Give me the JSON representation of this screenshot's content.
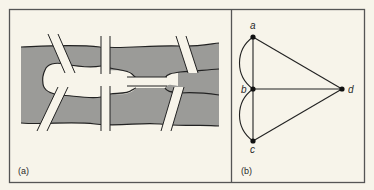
{
  "figure": {
    "panels": [
      {
        "id": "a",
        "label": "(a)",
        "description": "River with two islands and seven bridges (Königsberg bridges map)",
        "bridge_count": 7,
        "island_count": 2
      },
      {
        "id": "b",
        "label": "(b)",
        "description": "Multigraph of the bridge problem",
        "nodes": [
          {
            "id": "a",
            "label": "a"
          },
          {
            "id": "b",
            "label": "b"
          },
          {
            "id": "c",
            "label": "c"
          },
          {
            "id": "d",
            "label": "d"
          }
        ],
        "edges": [
          {
            "from": "a",
            "to": "b",
            "kind": "straight"
          },
          {
            "from": "a",
            "to": "b",
            "kind": "curved"
          },
          {
            "from": "b",
            "to": "c",
            "kind": "straight"
          },
          {
            "from": "b",
            "to": "c",
            "kind": "curved"
          },
          {
            "from": "a",
            "to": "d",
            "kind": "straight"
          },
          {
            "from": "b",
            "to": "d",
            "kind": "straight"
          },
          {
            "from": "c",
            "to": "d",
            "kind": "straight"
          }
        ]
      }
    ]
  },
  "colors": {
    "background": "#f7f4ea",
    "river": "#9b9b98",
    "ink": "#2a2a2a",
    "frame": "#555555"
  }
}
